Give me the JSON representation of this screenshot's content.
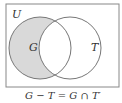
{
  "diagram": {
    "type": "venn",
    "universe_label": "U",
    "sets": [
      {
        "label": "G",
        "shaded_region": "G only"
      },
      {
        "label": "T"
      }
    ],
    "caption": "G − T = G ∩ T′",
    "colors": {
      "shade": "#d9d9d9",
      "stroke": "#777777"
    }
  }
}
